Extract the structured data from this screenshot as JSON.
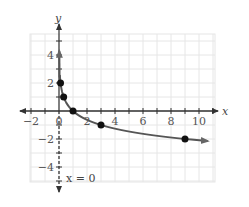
{
  "chart_data": {
    "type": "line",
    "title": "",
    "xlabel": "x",
    "ylabel": "y",
    "xlim": [
      -2,
      11
    ],
    "ylim": [
      -5,
      5
    ],
    "grid": true,
    "x_ticks": [
      -2,
      0,
      2,
      4,
      6,
      8,
      10
    ],
    "x_tick_labels": [
      "−2",
      "0",
      "2",
      "4",
      "6",
      "8",
      "10"
    ],
    "y_ticks": [
      -4,
      -2,
      2,
      4
    ],
    "y_tick_labels": [
      "−4",
      "−2",
      "2",
      "4"
    ],
    "series": [
      {
        "name": "curve",
        "function": "y = -log3(x)",
        "points": [
          {
            "x": 0.111,
            "y": 2
          },
          {
            "x": 0.333,
            "y": 1
          },
          {
            "x": 1,
            "y": 0
          },
          {
            "x": 3,
            "y": -1
          },
          {
            "x": 9,
            "y": -2
          }
        ],
        "color": "#555555"
      }
    ],
    "annotations": [
      {
        "text": "x = 0",
        "type": "asymptote",
        "x": 0
      }
    ]
  },
  "labels": {
    "x_axis": "x",
    "y_axis": "y",
    "asymptote": "x = 0",
    "origin": "0"
  }
}
